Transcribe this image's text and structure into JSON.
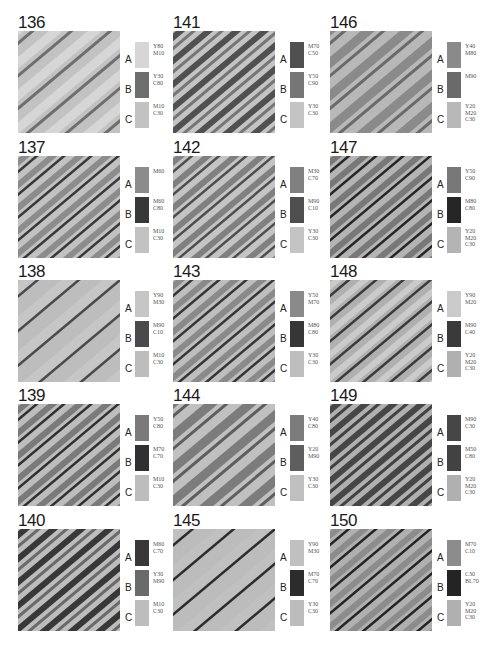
{
  "page": {
    "background": "#ffffff",
    "legend_letters": [
      "A",
      "B",
      "C"
    ]
  },
  "swatches": [
    {
      "id": "136",
      "pattern": "wide",
      "a": {
        "code": "Y80\nM10",
        "color": "#d6d6d6"
      },
      "b": {
        "code": "Y30\nC80",
        "color": "#6e6e6e"
      },
      "c": {
        "code": "M10\nC30",
        "color": "#c2c2c2"
      }
    },
    {
      "id": "137",
      "pattern": "medium",
      "a": {
        "code": "M60",
        "color": "#8c8c8c"
      },
      "b": {
        "code": "M60\nC80",
        "color": "#383838"
      },
      "c": {
        "code": "M10\nC30",
        "color": "#c2c2c2"
      }
    },
    {
      "id": "138",
      "pattern": "sparse",
      "a": {
        "code": "Y90\nM30",
        "color": "#c6c6c6"
      },
      "b": {
        "code": "M90\nC10",
        "color": "#4a4a4a"
      },
      "c": {
        "code": "M10\nC30",
        "color": "#bdbdbd"
      }
    },
    {
      "id": "139",
      "pattern": "medium",
      "a": {
        "code": "Y50\nC80",
        "color": "#7a7a7a"
      },
      "b": {
        "code": "M70\nC70",
        "color": "#303030"
      },
      "c": {
        "code": "M10\nC30",
        "color": "#bdbdbd"
      }
    },
    {
      "id": "140",
      "pattern": "bold",
      "a": {
        "code": "M60\nC70",
        "color": "#383838"
      },
      "b": {
        "code": "Y30\nM90",
        "color": "#6a6a6a"
      },
      "c": {
        "code": "M10\nC30",
        "color": "#bdbdbd"
      }
    },
    {
      "id": "141",
      "pattern": "bold",
      "a": {
        "code": "M70\nC50",
        "color": "#505050"
      },
      "b": {
        "code": "Y50\nC90",
        "color": "#767676"
      },
      "c": {
        "code": "Y30\nC30",
        "color": "#c4c4c4"
      }
    },
    {
      "id": "142",
      "pattern": "medium",
      "a": {
        "code": "M30\nC70",
        "color": "#808080"
      },
      "b": {
        "code": "M90\nC10",
        "color": "#4e4e4e"
      },
      "c": {
        "code": "Y30\nC30",
        "color": "#c4c4c4"
      }
    },
    {
      "id": "143",
      "pattern": "medium",
      "a": {
        "code": "Y50\nM70",
        "color": "#8a8a8a"
      },
      "b": {
        "code": "M80\nC80",
        "color": "#363636"
      },
      "c": {
        "code": "Y30\nC30",
        "color": "#bebebe"
      }
    },
    {
      "id": "144",
      "pattern": "wide",
      "a": {
        "code": "Y40\nC80",
        "color": "#7c7c7c"
      },
      "b": {
        "code": "Y20\nM90",
        "color": "#5e5e5e"
      },
      "c": {
        "code": "Y30\nC30",
        "color": "#c0c0c0"
      }
    },
    {
      "id": "145",
      "pattern": "sparse",
      "a": {
        "code": "Y90\nM30",
        "color": "#c0c0c0"
      },
      "b": {
        "code": "M70\nC70",
        "color": "#2c2c2c"
      },
      "c": {
        "code": "Y30\nC30",
        "color": "#bcbcbc"
      }
    },
    {
      "id": "146",
      "pattern": "wide",
      "a": {
        "code": "Y40\nM80",
        "color": "#8a8a8a"
      },
      "b": {
        "code": "M90",
        "color": "#6a6a6a"
      },
      "c": {
        "code": "Y20\nM20\nC30",
        "color": "#b8b8b8"
      }
    },
    {
      "id": "147",
      "pattern": "medium",
      "a": {
        "code": "Y50\nC90",
        "color": "#787878"
      },
      "b": {
        "code": "M80\nC80",
        "color": "#262626"
      },
      "c": {
        "code": "Y20\nM20\nC30",
        "color": "#b4b4b4"
      }
    },
    {
      "id": "148",
      "pattern": "medium",
      "a": {
        "code": "Y90\nM20",
        "color": "#cbcbcb"
      },
      "b": {
        "code": "M90\nC40",
        "color": "#3a3a3a"
      },
      "c": {
        "code": "Y20\nM20\nC30",
        "color": "#b0b0b0"
      }
    },
    {
      "id": "149",
      "pattern": "bold",
      "a": {
        "code": "M90\nC30",
        "color": "#464646"
      },
      "b": {
        "code": "M50\nC80",
        "color": "#424242"
      },
      "c": {
        "code": "Y20\nM20\nC30",
        "color": "#b0b0b0"
      }
    },
    {
      "id": "150",
      "pattern": "medium",
      "a": {
        "code": "M70\nC10",
        "color": "#8c8c8c"
      },
      "b": {
        "code": "C30\nBL70",
        "color": "#242424"
      },
      "c": {
        "code": "Y20\nM20\nC30",
        "color": "#b0b0b0"
      }
    }
  ]
}
